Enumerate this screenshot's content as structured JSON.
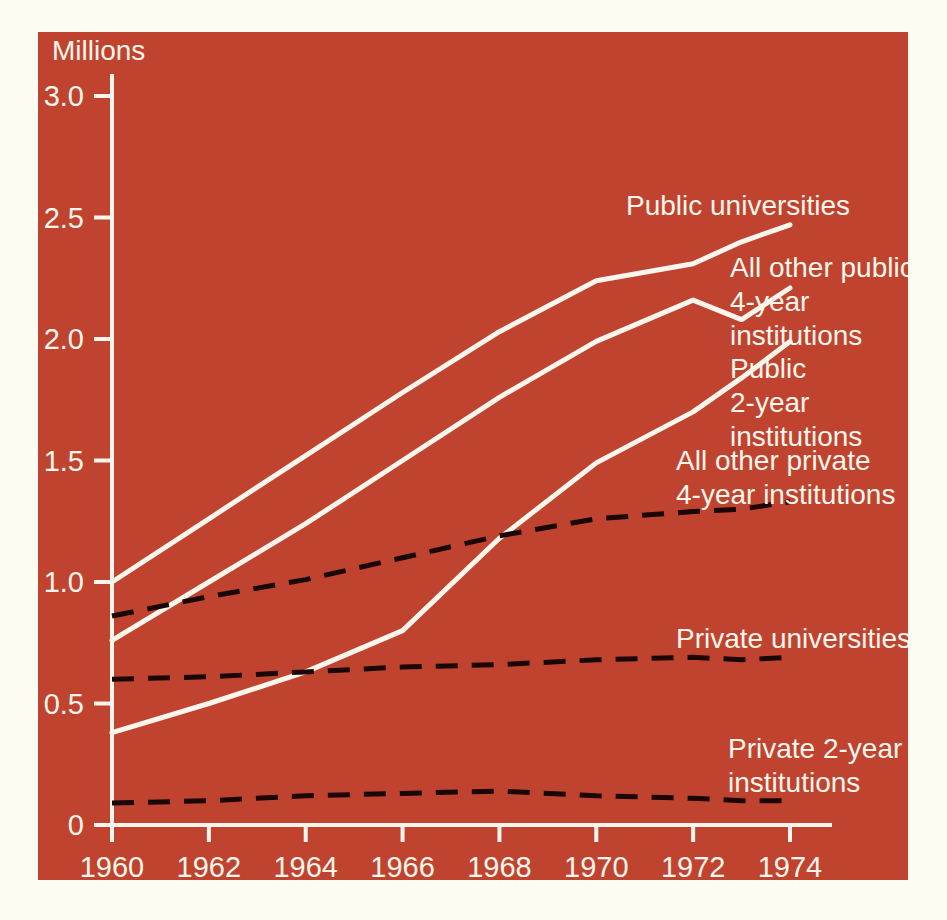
{
  "figure": {
    "unit_label": "Millions",
    "background_color": "#c0432f",
    "page_color": "#fdfbf2",
    "solid_line_color": "#fdf6ec",
    "dashed_line_color": "#1a0604"
  },
  "chart_data": {
    "type": "line",
    "title": "",
    "xlabel": "",
    "ylabel": "Millions",
    "xlim": [
      1960,
      1974
    ],
    "ylim": [
      0,
      3.0
    ],
    "grid": false,
    "legend_position": "inline-right",
    "x_ticks": [
      1960,
      1962,
      1964,
      1966,
      1968,
      1970,
      1972,
      1974
    ],
    "x_tick_labels": [
      "1960",
      "1962",
      "1964",
      "1966",
      "1968",
      "1970",
      "1972",
      "1974"
    ],
    "y_ticks": [
      0,
      0.5,
      1.0,
      1.5,
      2.0,
      2.5,
      3.0
    ],
    "y_tick_labels": [
      "0",
      "0.5",
      "1.0",
      "1.5",
      "2.0",
      "2.5",
      "3.0"
    ],
    "x": [
      1960,
      1962,
      1964,
      1966,
      1968,
      1970,
      1972,
      1973,
      1974
    ],
    "series": [
      {
        "name": "Public universities",
        "style": "solid",
        "color": "#fdf6ec",
        "values": [
          1.0,
          1.26,
          1.52,
          1.78,
          2.03,
          2.24,
          2.31,
          2.4,
          2.47
        ]
      },
      {
        "name": "All other public 4-year institutions",
        "style": "solid",
        "color": "#fdf6ec",
        "values": [
          0.76,
          1.0,
          1.24,
          1.5,
          1.76,
          1.99,
          2.16,
          2.08,
          2.21
        ]
      },
      {
        "name": "Public 2-year institutions",
        "style": "solid",
        "color": "#fdf6ec",
        "values": [
          0.38,
          0.5,
          0.63,
          0.8,
          1.18,
          1.49,
          1.7,
          1.84,
          1.99
        ]
      },
      {
        "name": "All other private 4-year institutions",
        "style": "dashed",
        "color": "#1a0604",
        "values": [
          0.86,
          0.94,
          1.01,
          1.1,
          1.19,
          1.26,
          1.29,
          1.3,
          1.33
        ]
      },
      {
        "name": "Private universities",
        "style": "dashed",
        "color": "#1a0604",
        "values": [
          0.6,
          0.61,
          0.63,
          0.65,
          0.66,
          0.68,
          0.69,
          0.68,
          0.69
        ]
      },
      {
        "name": "Private 2-year institutions",
        "style": "dashed",
        "color": "#1a0604",
        "values": [
          0.09,
          0.1,
          0.12,
          0.13,
          0.14,
          0.12,
          0.11,
          0.1,
          0.1
        ]
      }
    ],
    "annotations": [
      {
        "text": "Public universities",
        "lines": [
          "Public universities"
        ]
      },
      {
        "text": "All other public 4-year institutions",
        "lines": [
          "All other public",
          "4-year",
          "institutions"
        ]
      },
      {
        "text": "Public 2-year institutions",
        "lines": [
          "Public",
          "2-year",
          "institutions"
        ]
      },
      {
        "text": "All other private 4-year institutions",
        "lines": [
          "All other private",
          "4-year institutions"
        ]
      },
      {
        "text": "Private universities",
        "lines": [
          "Private universities"
        ]
      },
      {
        "text": "Private 2-year institutions",
        "lines": [
          "Private 2-year",
          "institutions"
        ]
      }
    ]
  }
}
